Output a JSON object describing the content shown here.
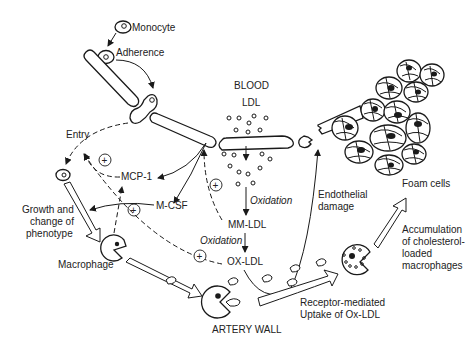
{
  "diagram": {
    "type": "biological pathway",
    "topic": "Atherosclerosis: monocyte recruitment and foam cell formation",
    "labels": {
      "monocyte": "Monocyte",
      "adherence": "Adherence",
      "entry": "Entry",
      "growth_1": "Growth and",
      "growth_2": "change of",
      "growth_3": "phenotype",
      "macrophage": "Macrophage",
      "mcp1": "MCP-1",
      "mcsf": "M-CSF",
      "blood": "BLOOD",
      "ldl": "LDL",
      "oxidation_1": "Oxidation",
      "mm_ldl": "MM-LDL",
      "oxidation_2": "Oxidation",
      "ox_ldl": "OX-LDL",
      "endothelial_1": "Endothelial",
      "endothelial_2": "damage",
      "foam_cells": "Foam cells",
      "accum_1": "Accumulation",
      "accum_2": "of cholesterol-",
      "accum_3": "loaded",
      "accum_4": "macrophages",
      "receptor_1": "Receptor-mediated",
      "receptor_2": "Uptake of Ox-LDL",
      "artery_wall": "ARTERY WALL"
    },
    "symbols": {
      "stimulation": "+"
    }
  }
}
